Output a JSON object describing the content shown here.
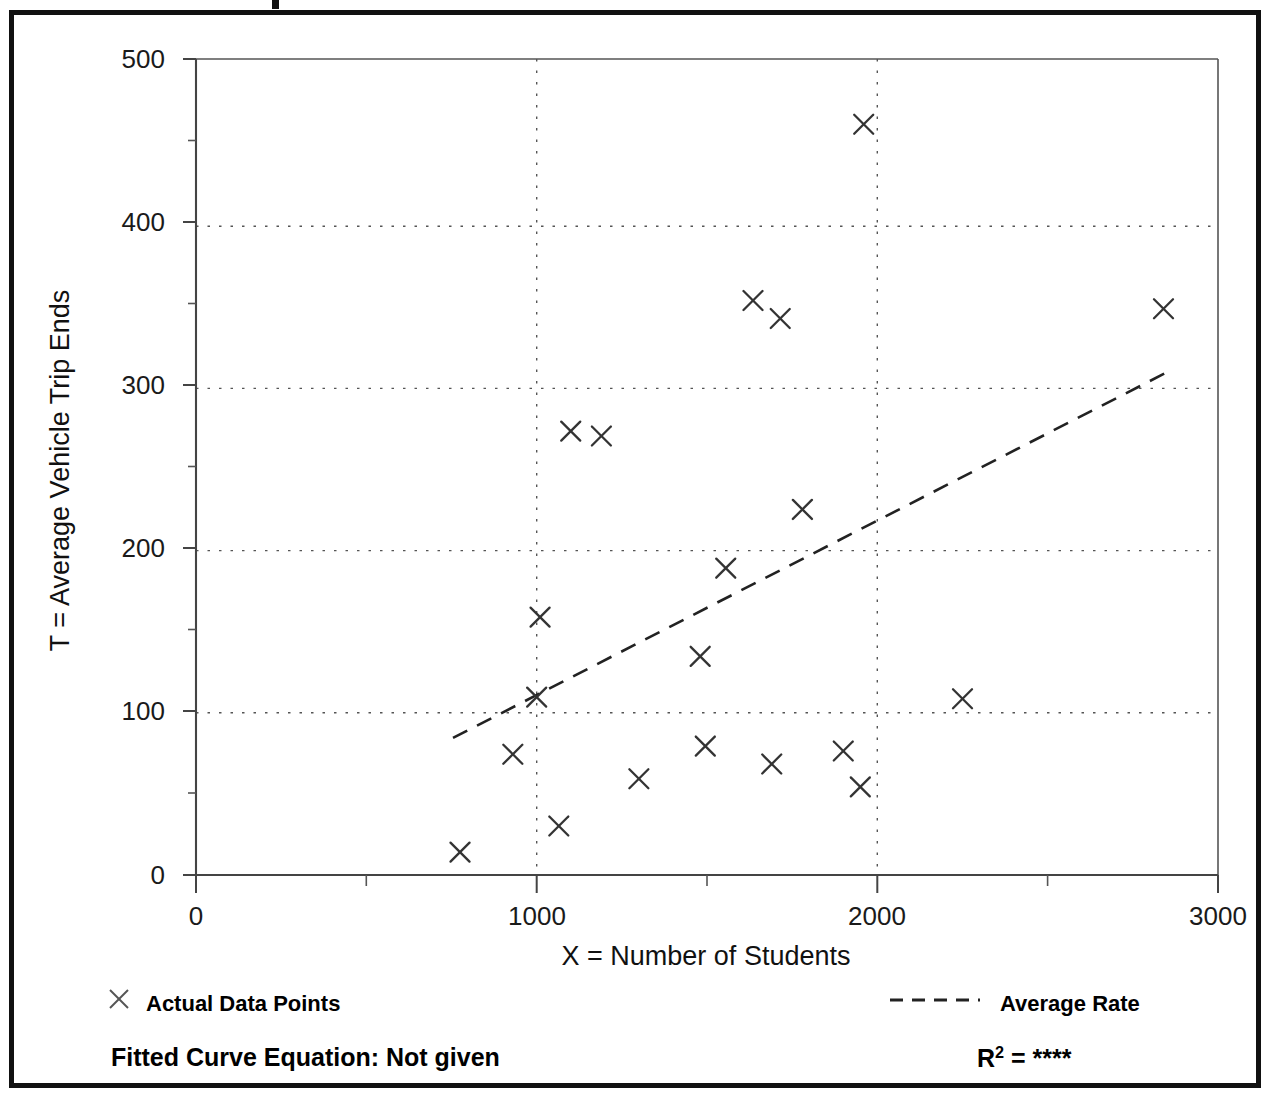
{
  "figure": {
    "frame_color": "#111111",
    "background": "#ffffff"
  },
  "chart_data": {
    "type": "scatter",
    "title": "",
    "xlabel": "X = Number of Students",
    "ylabel": "T = Average Vehicle Trip Ends",
    "xlim": [
      0,
      3000
    ],
    "ylim": [
      0,
      500
    ],
    "x_major_ticks": [
      0,
      1000,
      2000,
      3000
    ],
    "x_major_tick_labels": [
      "0",
      "1000",
      "2000",
      "3000"
    ],
    "x_minor_ticks": [
      500,
      1500,
      2500
    ],
    "y_major_ticks": [
      0,
      100,
      200,
      300,
      400,
      500
    ],
    "y_major_tick_labels": [
      "0",
      "100",
      "200",
      "300",
      "400",
      "500"
    ],
    "y_minor_ticks": [
      50,
      150,
      250,
      350,
      450
    ],
    "grid": "dotted major gridlines on both axes",
    "marker": "x",
    "marker_color": "#333333",
    "series": [
      {
        "name": "Actual Data Points",
        "points": [
          {
            "x": 775,
            "y": 14
          },
          {
            "x": 930,
            "y": 74
          },
          {
            "x": 1000,
            "y": 109
          },
          {
            "x": 1010,
            "y": 158
          },
          {
            "x": 1065,
            "y": 30
          },
          {
            "x": 1100,
            "y": 272
          },
          {
            "x": 1190,
            "y": 269
          },
          {
            "x": 1300,
            "y": 59
          },
          {
            "x": 1480,
            "y": 134
          },
          {
            "x": 1495,
            "y": 79
          },
          {
            "x": 1555,
            "y": 188
          },
          {
            "x": 1635,
            "y": 352
          },
          {
            "x": 1690,
            "y": 68
          },
          {
            "x": 1715,
            "y": 341
          },
          {
            "x": 1780,
            "y": 224
          },
          {
            "x": 1900,
            "y": 76
          },
          {
            "x": 1950,
            "y": 54
          },
          {
            "x": 1960,
            "y": 460
          },
          {
            "x": 2250,
            "y": 108
          },
          {
            "x": 2840,
            "y": 347
          }
        ]
      }
    ],
    "trendline": {
      "name": "Average Rate",
      "style": "dashed",
      "color": "#222222",
      "x_start": 755,
      "y_start": 84,
      "x_end": 2860,
      "y_end": 309
    },
    "legend": {
      "position": "below-plot",
      "entries": [
        {
          "marker": "x",
          "label": "Actual Data Points"
        },
        {
          "marker": "dashed-line",
          "label": "Average Rate"
        }
      ]
    },
    "annotations": {
      "equation_label": "Fitted Curve Equation:  Not given",
      "r2_prefix": "R",
      "r2_superscript": "2",
      "r2_equals": " = ",
      "r2_value": "****"
    }
  },
  "axes_geometry": {
    "plot_left_px": 196,
    "plot_right_px": 1218,
    "plot_top_px": 59,
    "plot_bottom_px": 875
  }
}
